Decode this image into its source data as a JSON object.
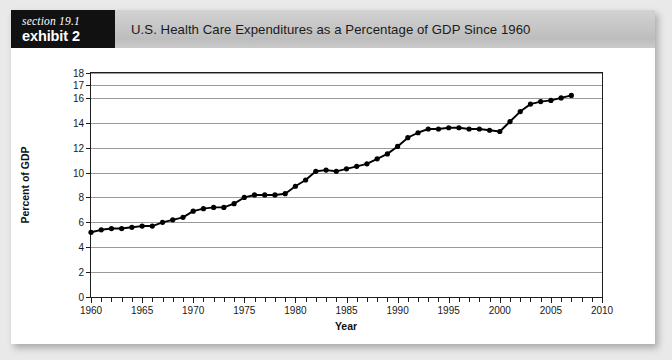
{
  "exhibit": {
    "section_label": "section 19.1",
    "exhibit_label": "exhibit 2",
    "title": "U.S. Health Care Expenditures as a Percentage of GDP Since 1960"
  },
  "colors": {
    "header_bar": "#c6c6c6",
    "tag_background": "#111111",
    "tag_text": "#ffffff",
    "page_background": "#e9e9e9",
    "card_background": "#ffffff",
    "gridline": "#9a9a9a",
    "axis": "#1d1d1d",
    "series": "#000000"
  },
  "chart_data": {
    "type": "line",
    "title": "U.S. Health Care Expenditures as a Percentage of GDP Since 1960",
    "xlabel": "Year",
    "ylabel": "Percent of GDP",
    "xlim": [
      1960,
      2010
    ],
    "ylim": [
      0,
      18
    ],
    "grid": true,
    "legend": null,
    "x_tick_labels": [
      "1960",
      "1965",
      "1970",
      "1975",
      "1980",
      "1985",
      "1990",
      "1995",
      "2000",
      "2005",
      "2010"
    ],
    "x_tick_values": [
      1960,
      1965,
      1970,
      1975,
      1980,
      1985,
      1990,
      1995,
      2000,
      2005,
      2010
    ],
    "x_minor_tick_step": 1,
    "y_tick_labels": [
      "0",
      "2",
      "4",
      "6",
      "8",
      "10",
      "12",
      "14",
      "16",
      "17",
      "18"
    ],
    "y_tick_values": [
      0,
      2,
      4,
      6,
      8,
      10,
      12,
      14,
      16,
      17,
      18
    ],
    "marker": "filled-circle",
    "series": [
      {
        "name": "U.S. Health Care Expenditures (% of GDP)",
        "x": [
          1960,
          1961,
          1962,
          1963,
          1964,
          1965,
          1966,
          1967,
          1968,
          1969,
          1970,
          1971,
          1972,
          1973,
          1974,
          1975,
          1976,
          1977,
          1978,
          1979,
          1980,
          1981,
          1982,
          1983,
          1984,
          1985,
          1986,
          1987,
          1988,
          1989,
          1990,
          1991,
          1992,
          1993,
          1994,
          1995,
          1996,
          1997,
          1998,
          1999,
          2000,
          2001,
          2002,
          2003,
          2004,
          2005,
          2006,
          2007
        ],
        "values": [
          5.2,
          5.4,
          5.5,
          5.5,
          5.6,
          5.7,
          5.7,
          6.0,
          6.2,
          6.4,
          6.9,
          7.1,
          7.2,
          7.2,
          7.5,
          8.0,
          8.2,
          8.2,
          8.2,
          8.3,
          8.9,
          9.4,
          10.1,
          10.2,
          10.1,
          10.3,
          10.5,
          10.7,
          11.1,
          11.5,
          12.1,
          12.8,
          13.2,
          13.5,
          13.5,
          13.6,
          13.6,
          13.5,
          13.5,
          13.4,
          13.3,
          14.1,
          14.9,
          15.5,
          15.7,
          15.8,
          16.0,
          16.2
        ]
      }
    ]
  }
}
